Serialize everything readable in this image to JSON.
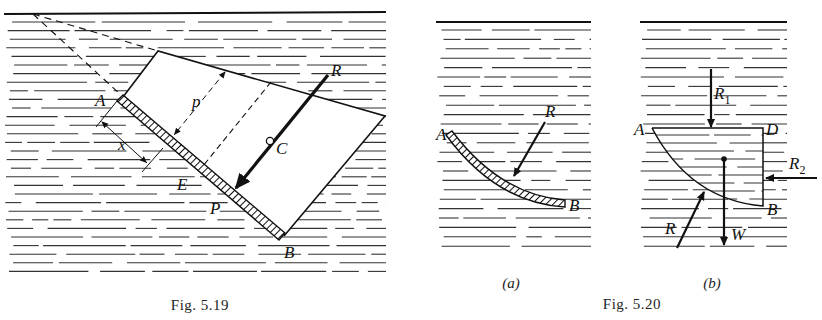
{
  "figures": [
    {
      "id": "fig-5-19",
      "caption": "Fig. 5.19",
      "labels": {
        "A": "A",
        "B": "B",
        "C": "C",
        "E": "E",
        "P": "P",
        "R": "R",
        "p": "p",
        "x": "x"
      },
      "description": "Inclined plane plate AB submerged in liquid with resultant force R acting at center of pressure P; centroid C; dimensions p and x"
    },
    {
      "id": "fig-5-20",
      "caption": "Fig. 5.20",
      "panels": [
        {
          "id": "a",
          "sublabel": "(a)",
          "labels": {
            "A": "A",
            "B": "B",
            "R": "R"
          }
        },
        {
          "id": "b",
          "sublabel": "(b)",
          "labels": {
            "A": "A",
            "B": "B",
            "D": "D",
            "R": "R",
            "R1": "R",
            "R1_sub": "1",
            "R2": "R",
            "R2_sub": "2",
            "W": "W"
          }
        }
      ],
      "description": "Curved surface AB submerged in liquid; (a) resultant R, (b) free body ADB with forces R1, R2, W and R"
    }
  ],
  "colors": {
    "ink": "#111111",
    "background": "#ffffff",
    "water_lines": "#333333"
  }
}
